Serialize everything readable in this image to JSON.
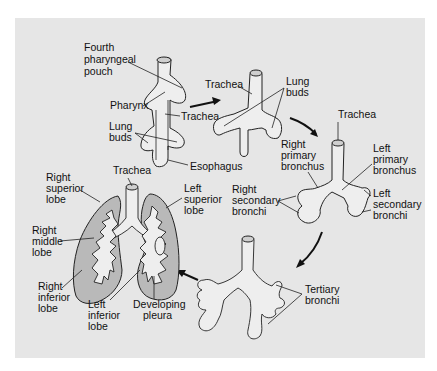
{
  "figure": {
    "background": "#e6e6e6",
    "lung_fill": "#b9b9b9",
    "stages": [
      {
        "id": "stage1",
        "labels": {
          "fourth_pouch": [
            "Fourth",
            "pharyngeal",
            "pouch"
          ],
          "pharynx": "Pharynx",
          "trachea": "Trachea",
          "lung_buds": [
            "Lung",
            "buds"
          ],
          "esophagus": "Esophagus"
        }
      },
      {
        "id": "stage2",
        "labels": {
          "trachea": "Trachea",
          "lung_buds": [
            "Lung",
            "buds"
          ]
        }
      },
      {
        "id": "stage3",
        "labels": {
          "trachea": "Trachea",
          "right_primary": [
            "Right",
            "primary",
            "bronchus"
          ],
          "left_primary": [
            "Left",
            "primary",
            "bronchus"
          ],
          "right_secondary": [
            "Right",
            "secondary",
            "bronchi"
          ],
          "left_secondary": [
            "Left",
            "secondary",
            "bronchi"
          ]
        }
      },
      {
        "id": "stage4",
        "labels": {
          "tertiary": [
            "Tertiary",
            "bronchi"
          ]
        }
      },
      {
        "id": "stage5",
        "labels": {
          "trachea": "Trachea",
          "right_superior": [
            "Right",
            "superior",
            "lobe"
          ],
          "right_middle": [
            "Right",
            "middle",
            "lobe"
          ],
          "right_inferior": [
            "Right",
            "inferior",
            "lobe"
          ],
          "left_superior": [
            "Left",
            "superior",
            "lobe"
          ],
          "left_inferior": [
            "Left",
            "inferior",
            "lobe"
          ],
          "pleura": [
            "Developing",
            "pleura"
          ]
        }
      }
    ]
  }
}
